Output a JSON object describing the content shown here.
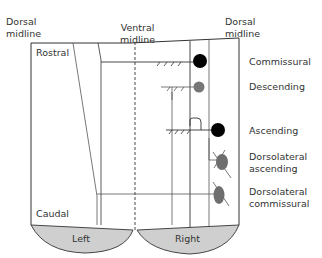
{
  "axis_labels": {
    "dorsal_midline_left": "Dorsal\nmidline",
    "ventral_midline": "Ventral\nmidline",
    "dorsal_midline_right": "Dorsal\nmidline",
    "rostral": "Rostral",
    "caudal": "Caudal"
  },
  "sides": {
    "left": "Left",
    "right": "Right"
  },
  "neuron_types": [
    {
      "label": "Commissural",
      "soma_color": "#000000"
    },
    {
      "label": "Descending",
      "soma_color": "#777777"
    },
    {
      "label": "Ascending",
      "soma_color": "#000000"
    },
    {
      "label": "Dorsolateral\nascending",
      "soma_color": "#6e6e6e"
    },
    {
      "label": "Dorsolateral\ncommissural",
      "soma_color": "#6e6e6e"
    }
  ],
  "colors": {
    "outline": "#333333",
    "half_fill": "#cfcfcf"
  }
}
